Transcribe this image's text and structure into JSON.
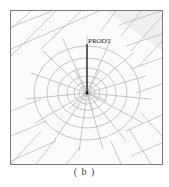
{
  "figure": {
    "label": "PROD5",
    "caption": "( b )",
    "colors": {
      "frame": "#7a7a7a",
      "mesh": "#b8b8b8",
      "rod": "#1a1a1a",
      "shade": "#eeeeee"
    }
  }
}
